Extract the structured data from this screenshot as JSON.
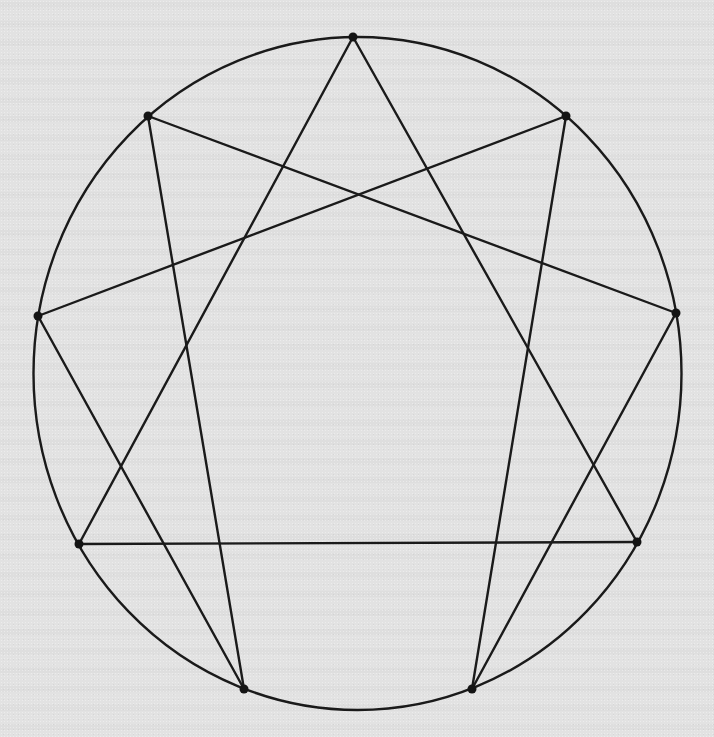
{
  "diagram": {
    "type": "enneagram",
    "colors": {
      "background": "#e2e2e2",
      "ink": "#1a1a1a"
    },
    "circle": {
      "cx": 357.5,
      "cy": 373.5,
      "rx": 324,
      "ry": 336.5
    },
    "points": [
      {
        "id": "p0",
        "position": "top",
        "x": 353,
        "y": 37
      },
      {
        "id": "p1",
        "position": "upper-right",
        "x": 566,
        "y": 116
      },
      {
        "id": "p2",
        "position": "right",
        "x": 676,
        "y": 313
      },
      {
        "id": "p3",
        "position": "lower-right",
        "x": 637,
        "y": 542
      },
      {
        "id": "p4",
        "position": "bottom-right",
        "x": 472,
        "y": 689
      },
      {
        "id": "p5",
        "position": "bottom-left",
        "x": 244,
        "y": 689
      },
      {
        "id": "p6",
        "position": "lower-left",
        "x": 79,
        "y": 544
      },
      {
        "id": "p7",
        "position": "left",
        "x": 38,
        "y": 316
      },
      {
        "id": "p8",
        "position": "upper-left",
        "x": 148,
        "y": 116
      }
    ],
    "edges": [
      {
        "group": "triangle",
        "from": "p0",
        "to": "p3"
      },
      {
        "group": "triangle",
        "from": "p3",
        "to": "p6"
      },
      {
        "group": "triangle",
        "from": "p6",
        "to": "p0"
      },
      {
        "group": "hexad",
        "from": "p8",
        "to": "p2"
      },
      {
        "group": "hexad",
        "from": "p2",
        "to": "p4"
      },
      {
        "group": "hexad",
        "from": "p4",
        "to": "p1"
      },
      {
        "group": "hexad",
        "from": "p1",
        "to": "p7"
      },
      {
        "group": "hexad",
        "from": "p7",
        "to": "p5"
      },
      {
        "group": "hexad",
        "from": "p5",
        "to": "p8"
      }
    ]
  }
}
